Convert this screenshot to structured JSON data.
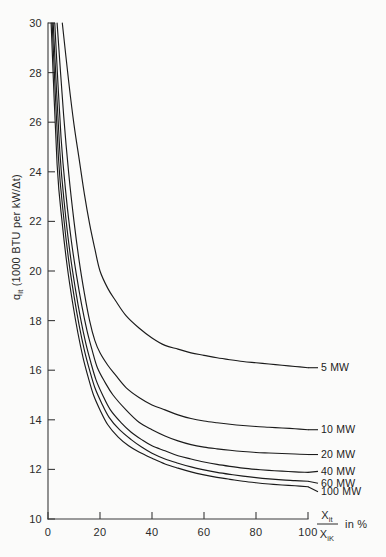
{
  "chart_data": {
    "type": "line",
    "title": "",
    "subtitle": "",
    "xlabel": "Xit / XiK in %",
    "ylabel": "qit (1000 BTU per kW/Δt)",
    "xlim": [
      0,
      100
    ],
    "ylim": [
      10,
      30
    ],
    "grid": false,
    "legend_position": "right-inline-labels",
    "xticks": [
      0,
      20,
      40,
      60,
      80,
      100
    ],
    "yticks": [
      10,
      12,
      14,
      16,
      18,
      20,
      22,
      24,
      26,
      28,
      30
    ],
    "xtick_labels": [
      "0",
      "20",
      "40",
      "60",
      "80",
      "100"
    ],
    "ytick_labels": [
      "10",
      "12",
      "14",
      "16",
      "18",
      "20",
      "22",
      "24",
      "26",
      "28",
      "30"
    ],
    "series": [
      {
        "name": "5 MW",
        "label": "5 MW",
        "x": [
          5.5,
          8,
          10,
          12,
          14,
          16,
          18,
          20,
          23,
          26,
          30,
          35,
          40,
          45,
          50,
          55,
          60,
          65,
          70,
          75,
          80,
          85,
          90,
          95,
          100
        ],
        "values": [
          30.0,
          27.6,
          25.9,
          24.5,
          23.1,
          21.9,
          20.9,
          20.0,
          19.3,
          18.8,
          18.2,
          17.7,
          17.3,
          17.0,
          16.85,
          16.7,
          16.6,
          16.5,
          16.42,
          16.35,
          16.3,
          16.25,
          16.2,
          16.15,
          16.1
        ]
      },
      {
        "name": "10 MW",
        "label": "10 MW",
        "x": [
          3.5,
          6,
          8,
          10,
          12,
          14,
          16,
          18,
          20,
          23,
          26,
          30,
          35,
          40,
          45,
          50,
          55,
          60,
          65,
          70,
          75,
          80,
          85,
          90,
          95,
          100
        ],
        "values": [
          30.0,
          26.3,
          23.9,
          22.0,
          20.4,
          19.1,
          18.0,
          17.2,
          16.7,
          16.2,
          15.8,
          15.3,
          14.9,
          14.6,
          14.4,
          14.2,
          14.05,
          13.95,
          13.88,
          13.82,
          13.77,
          13.73,
          13.7,
          13.67,
          13.64,
          13.6
        ]
      },
      {
        "name": "20 MW",
        "label": "20 MW",
        "x": [
          2.6,
          5,
          7,
          9,
          11,
          13,
          15,
          17,
          19,
          22,
          25,
          30,
          35,
          40,
          45,
          50,
          55,
          60,
          65,
          70,
          75,
          80,
          85,
          90,
          95,
          100
        ],
        "values": [
          30.0,
          25.4,
          23.0,
          21.2,
          19.8,
          18.6,
          17.6,
          16.8,
          16.1,
          15.5,
          15.0,
          14.4,
          13.9,
          13.6,
          13.35,
          13.15,
          13.0,
          12.9,
          12.83,
          12.77,
          12.72,
          12.68,
          12.66,
          12.64,
          12.62,
          12.6
        ]
      },
      {
        "name": "40 MW",
        "label": "40 MW",
        "x": [
          2.0,
          4.5,
          6.5,
          8.5,
          10.5,
          12.5,
          14.5,
          16.5,
          18.5,
          21,
          24,
          28,
          32,
          36,
          40,
          45,
          50,
          55,
          60,
          65,
          70,
          75,
          80,
          85,
          90,
          95,
          100
        ],
        "values": [
          30.0,
          24.9,
          22.5,
          20.7,
          19.3,
          18.1,
          17.1,
          16.3,
          15.6,
          15.0,
          14.4,
          13.9,
          13.5,
          13.2,
          12.95,
          12.75,
          12.55,
          12.42,
          12.3,
          12.2,
          12.12,
          12.05,
          12.0,
          11.96,
          11.93,
          11.9,
          11.88
        ]
      },
      {
        "name": "60 MW",
        "label": "60 MW",
        "x": [
          1.6,
          4,
          6,
          8,
          10,
          12,
          14,
          16,
          18,
          20.5,
          23.5,
          27.5,
          32,
          36,
          40,
          45,
          50,
          55,
          60,
          65,
          70,
          75,
          80,
          85,
          90,
          95,
          100
        ],
        "values": [
          30.0,
          24.6,
          22.2,
          20.4,
          19.0,
          17.8,
          16.8,
          16.0,
          15.3,
          14.7,
          14.1,
          13.6,
          13.2,
          12.9,
          12.65,
          12.42,
          12.25,
          12.1,
          11.98,
          11.88,
          11.8,
          11.73,
          11.67,
          11.62,
          11.58,
          11.55,
          11.52
        ]
      },
      {
        "name": "100 MW",
        "label": "100 MW",
        "x": [
          1.2,
          3.5,
          5.5,
          7.5,
          9.5,
          11.5,
          13.5,
          15.5,
          17.5,
          20,
          23,
          27,
          31,
          35,
          40,
          45,
          50,
          55,
          60,
          65,
          70,
          75,
          80,
          85,
          90,
          95,
          100
        ],
        "values": [
          30.0,
          24.3,
          21.9,
          20.1,
          18.7,
          17.5,
          16.5,
          15.7,
          15.0,
          14.4,
          13.8,
          13.3,
          12.95,
          12.7,
          12.45,
          12.22,
          12.05,
          11.9,
          11.78,
          11.68,
          11.6,
          11.52,
          11.46,
          11.41,
          11.37,
          11.34,
          11.3
        ]
      }
    ]
  },
  "axis": {
    "y_title_main": "q",
    "y_title_sub": "it",
    "y_title_rest": " (1000 BTU per kW/Δt)",
    "x_title_num_main": "X",
    "x_title_num_sub": "it",
    "x_title_den_main": "X",
    "x_title_den_sub": "iK",
    "x_title_suffix": "in %"
  },
  "colors": {
    "background": "#fbfbfa",
    "ink": "#1b1b1b",
    "axis": "#3a3a3a"
  }
}
